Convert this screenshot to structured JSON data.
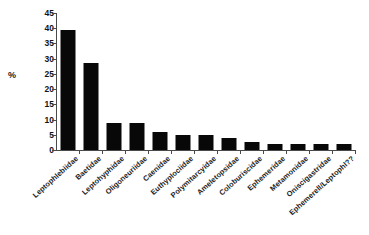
{
  "chart_data": {
    "type": "bar",
    "title": "",
    "subtitle": "",
    "xlabel": "",
    "ylabel": "%",
    "ylim": [
      0,
      45
    ],
    "ytick_step": 5,
    "yticks": [
      "45",
      "40",
      "35",
      "30",
      "25",
      "20",
      "15",
      "10",
      "5",
      "0"
    ],
    "grid": false,
    "legend": "none",
    "bar_color": "#080808",
    "axis_color": "#4a4a4a",
    "categories": [
      "Leptophlebiidae",
      "Baetidae",
      "Leptohyphidae",
      "Oligoneuriidae",
      "Caenidae",
      "Euthyplociidae",
      "Polymitarcyidae",
      "Ameletopsidae",
      "Coloburiscidae",
      "Ephemeridae",
      "Metamonidae",
      "Oniscigastridae",
      "Ephemerell/Leptophl??"
    ],
    "values": [
      39.5,
      28.5,
      9,
      9,
      6,
      5,
      5,
      4,
      2.5,
      2,
      2,
      2,
      2
    ]
  }
}
